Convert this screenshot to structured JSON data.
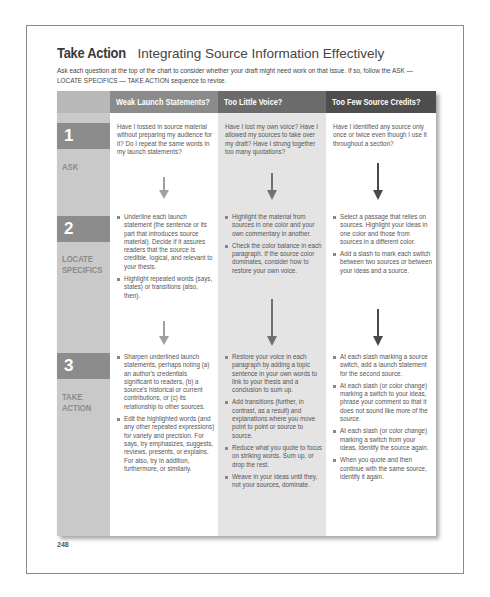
{
  "header": {
    "title_bold": "Take Action",
    "title_rest": "Integrating Source Information Effectively",
    "intro": "Ask each question at the top of the chart to consider whether your draft might need work on that issue. If so, follow the ASK — LOCATE SPECIFICS — TAKE ACTION sequence to revise."
  },
  "steps": [
    {
      "number": "1",
      "label": "ASK"
    },
    {
      "number": "2",
      "label": "LOCATE SPECIFICS"
    },
    {
      "number": "3",
      "label": "TAKE ACTION"
    }
  ],
  "columns": [
    {
      "heading": "Weak Launch Statements?",
      "ask": "Have I tossed in source material without preparing my audience for it? Do I repeat the same words in my launch statements?",
      "locate": [
        "Underline each launch statement (the sentence or its part that introduces source material). Decide if it assures readers that the source is credible, logical, and relevant to your thesis.",
        "Highlight repeated words (says, states) or transitions (also, then)."
      ],
      "action": [
        "Sharpen underlined launch statements, perhaps noting (a) an author's credentials significant to readers, (b) a source's historical or current contributions, or (c) its relationship to other sources.",
        "Edit the highlighted words (and any other repeated expressions) for variety and precision. For says, try emphasizes, suggests, reviews, presents, or explains. For also, try in addition, furthermore, or similarly."
      ]
    },
    {
      "heading": "Too Little Voice?",
      "ask": "Have I lost my own voice? Have I allowed my sources to take over my draft? Have I strung together too many quotations?",
      "locate": [
        "Highlight the material from sources in one color and your own commentary in another.",
        "Check the color balance in each paragraph. If the source color dominates, consider how to restore your own voice."
      ],
      "action": [
        "Restore your voice in each paragraph by adding a topic sentence in your own words to link to your thesis and a conclusion to sum up.",
        "Add transitions (further, in contrast, as a result) and explanations where you move point to point or source to source.",
        "Reduce what you quote to focus on striking words. Sum up, or drop the rest.",
        "Weave in your ideas until they, not your sources, dominate."
      ]
    },
    {
      "heading": "Too Few Source Credits?",
      "ask": "Have I identified any source only once or twice even though I use it throughout a section?",
      "locate": [
        "Select a passage that relies on sources. Highlight your ideas in one color and those from sources in a different color.",
        "Add a slash to mark each switch between two sources or between your ideas and a source."
      ],
      "action": [
        "At each slash marking a source switch, add a launch statement for the second source.",
        "At each slash (or color change) marking a switch to your ideas, phrase your comment so that it does not sound like more of the source.",
        "At each slash (or color change) marking a switch from your ideas, identify the source again.",
        "When you quote and then continue with the same source, identify it again."
      ]
    }
  ],
  "arrow_colors": [
    "#9a9a9a",
    "#6e6e6e",
    "#4a4a4a"
  ],
  "page_number": "248"
}
